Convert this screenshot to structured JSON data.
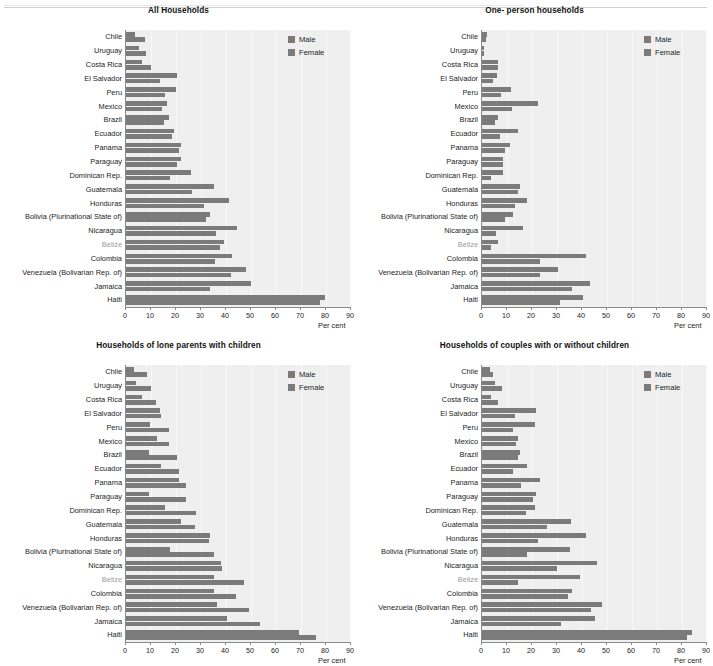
{
  "page": {
    "background": "#ffffff",
    "bar_color": "#7b7b7b",
    "plot_background": "#efefef",
    "axis_color": "#8a8a8a"
  },
  "legend": {
    "male_label": "Male",
    "female_label": "Female"
  },
  "axis": {
    "x_title": "Per cent",
    "ticks": [
      "0",
      "10",
      "20",
      "30",
      "40",
      "50",
      "60",
      "70",
      "80",
      "90"
    ],
    "min": 0,
    "max": 90
  },
  "categories": [
    "Chile",
    "Uruguay",
    "Costa Rica",
    "El Salvador",
    "Peru",
    "Mexico",
    "Brazil",
    "Ecuador",
    "Panama",
    "Paraguay",
    "Dominican Rep.",
    "Guatemala",
    "Honduras",
    "Bolivia (Plurinational State of)",
    "Nicaragua",
    "Belize",
    "Colombia",
    "Venezuela (Bolivarian Rep. of)",
    "Jamaica",
    "Haiti"
  ],
  "chart_data": [
    {
      "type": "bar",
      "orientation": "horizontal",
      "title": "All Households",
      "xlabel": "Per cent",
      "ylabel": "",
      "xlim": [
        0,
        90
      ],
      "grid": true,
      "legend_position": "top-right",
      "categories": [
        "Chile",
        "Uruguay",
        "Costa Rica",
        "El Salvador",
        "Peru",
        "Mexico",
        "Brazil",
        "Ecuador",
        "Panama",
        "Paraguay",
        "Dominican Rep.",
        "Guatemala",
        "Honduras",
        "Bolivia (Plurinational State of)",
        "Nicaragua",
        "Belize",
        "Colombia",
        "Venezuela (Bolivarian Rep. of)",
        "Jamaica",
        "Haiti"
      ],
      "series": [
        {
          "name": "Male",
          "values": [
            3.5,
            5.0,
            6.5,
            20.5,
            20.0,
            16.5,
            17.0,
            19.0,
            22.0,
            22.0,
            26.0,
            35.0,
            41.0,
            33.5,
            44.5,
            39.0,
            42.5,
            48.0,
            50.0,
            79.5
          ]
        },
        {
          "name": "Female",
          "values": [
            7.5,
            8.0,
            10.0,
            13.5,
            15.5,
            14.5,
            15.0,
            18.5,
            21.0,
            20.5,
            17.5,
            26.5,
            31.0,
            32.0,
            36.0,
            37.5,
            35.5,
            42.0,
            33.5,
            77.5
          ]
        }
      ]
    },
    {
      "type": "bar",
      "orientation": "horizontal",
      "title": "One- person households",
      "xlabel": "Per cent",
      "ylabel": "",
      "xlim": [
        0,
        90
      ],
      "grid": true,
      "legend_position": "top-right",
      "categories": [
        "Chile",
        "Uruguay",
        "Costa Rica",
        "El Salvador",
        "Peru",
        "Mexico",
        "Brazil",
        "Ecuador",
        "Panama",
        "Paraguay",
        "Dominican Rep.",
        "Guatemala",
        "Honduras",
        "Bolivia (Plurinational State of)",
        "Nicaragua",
        "Belize",
        "Colombia",
        "Venezuela (Bolivarian Rep. of)",
        "Jamaica",
        "Haiti"
      ],
      "series": [
        {
          "name": "Male",
          "values": [
            1.8,
            0.8,
            6.5,
            6.0,
            11.5,
            22.5,
            6.5,
            14.5,
            11.0,
            8.5,
            8.5,
            15.0,
            18.0,
            12.5,
            16.5,
            6.5,
            41.5,
            30.5,
            43.0,
            40.5
          ]
        },
        {
          "name": "Female",
          "values": [
            1.5,
            0.6,
            6.5,
            4.5,
            7.5,
            12.0,
            5.0,
            7.0,
            9.0,
            8.5,
            3.5,
            14.5,
            13.0,
            9.0,
            5.5,
            3.5,
            23.0,
            23.0,
            36.0,
            31.0
          ]
        }
      ]
    },
    {
      "type": "bar",
      "orientation": "horizontal",
      "title": "Households of lone parents with children",
      "xlabel": "Per cent",
      "ylabel": "",
      "xlim": [
        0,
        90
      ],
      "grid": true,
      "legend_position": "top-right",
      "categories": [
        "Chile",
        "Uruguay",
        "Costa Rica",
        "El Salvador",
        "Peru",
        "Mexico",
        "Brazil",
        "Ecuador",
        "Panama",
        "Paraguay",
        "Dominican Rep.",
        "Guatemala",
        "Honduras",
        "Bolivia (Plurinational State of)",
        "Nicaragua",
        "Belize",
        "Colombia",
        "Venezuela (Bolivarian Rep. of)",
        "Jamaica",
        "Haiti"
      ],
      "series": [
        {
          "name": "Male",
          "values": [
            3.0,
            4.0,
            6.5,
            13.5,
            9.5,
            12.5,
            9.0,
            14.0,
            21.0,
            9.0,
            15.5,
            22.0,
            33.5,
            17.5,
            38.0,
            35.0,
            35.0,
            36.5,
            40.5,
            69.0
          ]
        },
        {
          "name": "Female",
          "values": [
            8.5,
            10.0,
            12.0,
            14.0,
            17.0,
            17.0,
            20.5,
            21.0,
            24.0,
            24.0,
            28.0,
            27.5,
            33.0,
            35.0,
            38.5,
            47.0,
            44.0,
            49.0,
            53.5,
            76.0
          ]
        }
      ]
    },
    {
      "type": "bar",
      "orientation": "horizontal",
      "title": "Households of couples with or without children",
      "xlabel": "Per cent",
      "ylabel": "",
      "xlim": [
        0,
        90
      ],
      "grid": true,
      "legend_position": "top-right",
      "categories": [
        "Chile",
        "Uruguay",
        "Costa Rica",
        "El Salvador",
        "Peru",
        "Mexico",
        "Brazil",
        "Ecuador",
        "Panama",
        "Paraguay",
        "Dominican Rep.",
        "Guatemala",
        "Honduras",
        "Bolivia (Plurinational State of)",
        "Nicaragua",
        "Belize",
        "Colombia",
        "Venezuela (Bolivarian Rep. of)",
        "Jamaica",
        "Haiti"
      ],
      "series": [
        {
          "name": "Male",
          "values": [
            3.0,
            5.0,
            3.5,
            21.5,
            21.0,
            14.5,
            15.0,
            18.0,
            23.0,
            21.5,
            21.0,
            35.5,
            41.5,
            35.0,
            46.0,
            39.0,
            36.0,
            48.0,
            45.0,
            84.0
          ]
        },
        {
          "name": "Female",
          "values": [
            4.5,
            8.0,
            6.5,
            13.0,
            12.5,
            13.5,
            14.5,
            12.5,
            15.5,
            20.5,
            17.5,
            26.0,
            22.5,
            18.0,
            30.0,
            14.5,
            34.5,
            43.5,
            31.5,
            82.0
          ]
        }
      ]
    }
  ]
}
